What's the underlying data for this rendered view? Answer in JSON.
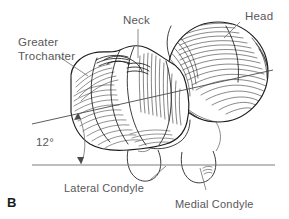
{
  "figure": {
    "panel_letter": "B",
    "background_color": "#ffffff",
    "ink_color": "#1d1d1f",
    "label_color": "#58585a"
  },
  "labels": {
    "greater_trochanter_line1": "Greater",
    "greater_trochanter_line2": "Trochanter",
    "neck": "Neck",
    "head": "Head",
    "lateral_condyle": "Lateral Condyle",
    "medial_condyle": "Medial Condyle"
  },
  "measurement": {
    "angle_value": "12",
    "angle_unit": "°",
    "angle_text": "12°"
  },
  "geometry": {
    "axis_line": {
      "x1": 32,
      "y1": 124,
      "x2": 273,
      "y2": 70
    },
    "baseline": {
      "x1": 32,
      "y1": 165,
      "x2": 275,
      "y2": 165
    },
    "angle_arc_radius": 48
  }
}
